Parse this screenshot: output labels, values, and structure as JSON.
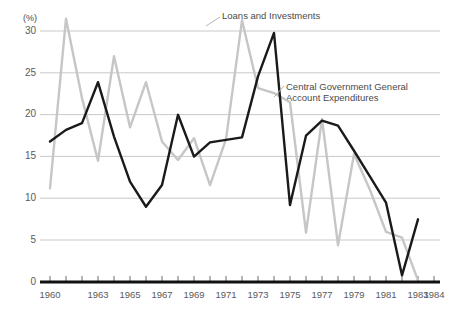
{
  "chart_data": {
    "type": "line",
    "title": "",
    "xlabel": "",
    "ylabel": "(%)",
    "unit_label": "(%)",
    "xlim": [
      1960,
      1984
    ],
    "ylim": [
      0,
      32
    ],
    "grid": true,
    "grid_axis": "y",
    "legend_position": "inline-annotations",
    "yticks": [
      0,
      5,
      10,
      15,
      20,
      25,
      30
    ],
    "ytick_labels": [
      "0",
      "5",
      "10",
      "15",
      "20",
      "25",
      "30"
    ],
    "xticks": [
      1960,
      1961,
      1962,
      1963,
      1964,
      1965,
      1966,
      1967,
      1968,
      1969,
      1970,
      1971,
      1972,
      1973,
      1974,
      1975,
      1976,
      1977,
      1978,
      1979,
      1980,
      1981,
      1982,
      1983,
      1984
    ],
    "xtick_labels_shown": [
      "1960",
      "1963",
      "1965",
      "1967",
      "1969",
      "1971",
      "1973",
      "1975",
      "1977",
      "1979",
      "1981",
      "1983",
      "1984"
    ],
    "x": [
      1960,
      1961,
      1962,
      1963,
      1964,
      1965,
      1966,
      1967,
      1968,
      1969,
      1970,
      1971,
      1972,
      1973,
      1974,
      1975,
      1976,
      1977,
      1978,
      1979,
      1980,
      1981,
      1982,
      1983
    ],
    "series": [
      {
        "name": "Loans and Investments",
        "color": "#c6c6c6",
        "values": [
          11.2,
          31.5,
          22.0,
          14.5,
          27.0,
          18.5,
          23.9,
          16.8,
          14.6,
          17.2,
          11.6,
          17.1,
          31.3,
          23.2,
          22.6,
          21.5,
          5.9,
          19.5,
          4.4,
          15.3,
          11.0,
          6.0,
          5.3,
          0.2
        ]
      },
      {
        "name": "Central Government General Account Expenditures",
        "color": "#1a1a1a",
        "values": [
          16.8,
          18.2,
          19.0,
          23.9,
          17.4,
          12.0,
          9.0,
          11.6,
          20.0,
          15.0,
          16.7,
          17.0,
          17.3,
          24.6,
          29.8,
          9.2,
          17.5,
          19.3,
          18.7,
          15.7,
          12.6,
          9.5,
          0.8,
          7.5
        ]
      }
    ],
    "annotations": [
      {
        "text": "Loans and Investments",
        "target_series": "Loans and Investments",
        "target_x": 1972
      },
      {
        "text": "Central Government General\nAccount Expenditures",
        "line1": "Central Government General",
        "line2": "Account Expenditures",
        "target_series": "Central Government General Account Expenditures",
        "target_x": 1974
      }
    ]
  }
}
